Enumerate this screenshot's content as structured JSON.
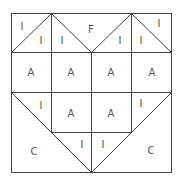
{
  "diagram": {
    "type": "quilt-block",
    "colors": {
      "line": "#444444",
      "label": "#555555",
      "background": "#ffffff"
    },
    "grid": {
      "rows": 4,
      "cols": 4
    },
    "labels": [
      {
        "id": "l1",
        "text": "I",
        "x": 22,
        "y": 27
      },
      {
        "id": "l2",
        "text": "I",
        "x": 41,
        "y": 41
      },
      {
        "id": "l3",
        "text": "I",
        "x": 62,
        "y": 41
      },
      {
        "id": "l4",
        "text": "F",
        "x": 91,
        "y": 30
      },
      {
        "id": "l5",
        "text": "I",
        "x": 120,
        "y": 41
      },
      {
        "id": "l6",
        "text": "I",
        "x": 141,
        "y": 41
      },
      {
        "id": "l7",
        "text": "I",
        "x": 159,
        "y": 24
      },
      {
        "id": "l8",
        "text": "A",
        "x": 31,
        "y": 73
      },
      {
        "id": "l9",
        "text": "A",
        "x": 71,
        "y": 73
      },
      {
        "id": "l10",
        "text": "A",
        "x": 111,
        "y": 73
      },
      {
        "id": "l11",
        "text": "A",
        "x": 152,
        "y": 73
      },
      {
        "id": "l12",
        "text": "I",
        "x": 41,
        "y": 106
      },
      {
        "id": "l13",
        "text": "A",
        "x": 71,
        "y": 114
      },
      {
        "id": "l14",
        "text": "A",
        "x": 111,
        "y": 114
      },
      {
        "id": "l15",
        "text": "I",
        "x": 141,
        "y": 104
      },
      {
        "id": "l16",
        "text": "C",
        "x": 34,
        "y": 152
      },
      {
        "id": "l17",
        "text": "I",
        "x": 82,
        "y": 145
      },
      {
        "id": "l18",
        "text": "I",
        "x": 103,
        "y": 145
      },
      {
        "id": "l19",
        "text": "C",
        "x": 151,
        "y": 151
      }
    ]
  }
}
